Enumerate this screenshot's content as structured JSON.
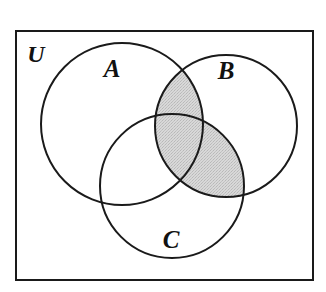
{
  "figure": {
    "type": "venn-diagram",
    "set_count": 3,
    "shaded_description": "(A intersect B) union (B intersect C)",
    "universe": {
      "label": "U",
      "name": "universal-set",
      "shape": "rectangle",
      "fill": "#ffffff",
      "stroke": "#1a1a1a",
      "stroke_width": 2,
      "x": 16,
      "y": 31,
      "width": 297,
      "height": 249,
      "label_x": 36,
      "label_y": 56
    },
    "sets": [
      {
        "label": "A",
        "name": "set-a",
        "cx": 122,
        "cy": 124,
        "r": 81,
        "label_x": 112,
        "label_y": 71,
        "stroke": "#1a1a1a",
        "stroke_width": 2,
        "fill": "none"
      },
      {
        "label": "B",
        "name": "set-b",
        "cx": 226,
        "cy": 126,
        "r": 71,
        "label_x": 226,
        "label_y": 73,
        "stroke": "#1a1a1a",
        "stroke_width": 2,
        "fill": "none"
      },
      {
        "label": "C",
        "name": "set-c",
        "cx": 172,
        "cy": 186,
        "r": 72,
        "label_x": 171,
        "label_y": 242,
        "stroke": "#1a1a1a",
        "stroke_width": 2,
        "fill": "none"
      }
    ],
    "shaded_regions": [
      {
        "name": "region-a-intersect-b",
        "expression": "A ∩ B",
        "shaded": true
      },
      {
        "name": "region-b-intersect-c",
        "expression": "B ∩ C",
        "shaded": true
      },
      {
        "name": "region-a-intersect-b-intersect-c",
        "expression": "A ∩ B ∩ C",
        "shaded": true
      },
      {
        "name": "region-a-intersect-c-only",
        "expression": "(A ∩ C) − B",
        "shaded": false
      }
    ],
    "colors": {
      "shade_fill": "#d2d2d2",
      "outline": "#1a1a1a",
      "background": "#ffffff",
      "label_color": "#111111"
    }
  }
}
